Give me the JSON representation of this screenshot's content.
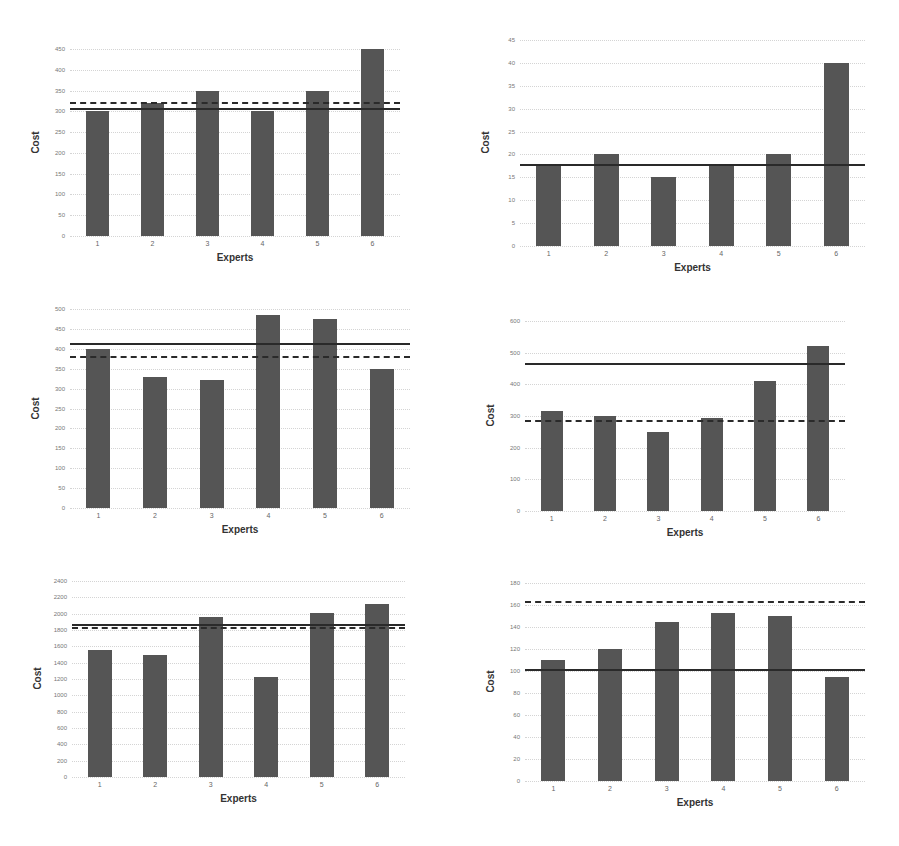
{
  "chart_data": [
    {
      "type": "bar",
      "position": "top-left",
      "title": "",
      "xlabel": "Experts",
      "ylabel": "Cost",
      "categories": [
        "1",
        "2",
        "3",
        "4",
        "5",
        "6"
      ],
      "values": [
        300,
        320,
        350,
        300,
        350,
        450
      ],
      "ylim": [
        0,
        450
      ],
      "yticks": [
        0,
        50,
        100,
        150,
        200,
        250,
        300,
        350,
        400,
        450
      ],
      "reference_lines": {
        "solid": 305,
        "dashed": 320
      },
      "grid": true
    },
    {
      "type": "bar",
      "position": "top-right",
      "title": "",
      "xlabel": "Experts",
      "ylabel": "Cost",
      "categories": [
        "1",
        "2",
        "3",
        "4",
        "5",
        "6"
      ],
      "values": [
        18,
        20,
        15,
        18,
        20,
        40
      ],
      "ylim": [
        0,
        45
      ],
      "yticks": [
        0,
        5,
        10,
        15,
        20,
        25,
        30,
        35,
        40,
        45
      ],
      "reference_lines": {
        "solid": 17.8,
        "dashed": 17.8
      },
      "grid": true
    },
    {
      "type": "bar",
      "position": "middle-left",
      "title": "",
      "xlabel": "Experts",
      "ylabel": "Cost",
      "categories": [
        "1",
        "2",
        "3",
        "4",
        "5",
        "6"
      ],
      "values": [
        400,
        330,
        322,
        485,
        475,
        350
      ],
      "ylim": [
        0,
        500
      ],
      "yticks": [
        0,
        50,
        100,
        150,
        200,
        250,
        300,
        350,
        400,
        450,
        500
      ],
      "reference_lines": {
        "solid": 412,
        "dashed": 380
      },
      "grid": true
    },
    {
      "type": "bar",
      "position": "middle-right",
      "title": "",
      "xlabel": "Experts",
      "ylabel": "Cost",
      "categories": [
        "1",
        "2",
        "3",
        "4",
        "5",
        "6"
      ],
      "values": [
        315,
        300,
        250,
        295,
        410,
        520
      ],
      "ylim": [
        0,
        600
      ],
      "yticks": [
        0,
        100,
        200,
        300,
        400,
        500,
        600
      ],
      "reference_lines": {
        "solid": 465,
        "dashed": 285
      },
      "grid": true
    },
    {
      "type": "bar",
      "position": "bottom-left",
      "title": "",
      "xlabel": "Experts",
      "ylabel": "Cost",
      "categories": [
        "1",
        "2",
        "3",
        "4",
        "5",
        "6"
      ],
      "values": [
        1550,
        1500,
        1960,
        1220,
        2010,
        2120
      ],
      "ylim": [
        0,
        2400
      ],
      "yticks": [
        0,
        200,
        400,
        600,
        800,
        1000,
        1200,
        1400,
        1600,
        1800,
        2000,
        2200,
        2400
      ],
      "reference_lines": {
        "solid": 1860,
        "dashed": 1820
      },
      "grid": true
    },
    {
      "type": "bar",
      "position": "bottom-right",
      "title": "",
      "xlabel": "Experts",
      "ylabel": "Cost",
      "categories": [
        "1",
        "2",
        "3",
        "4",
        "5",
        "6"
      ],
      "values": [
        110,
        120,
        145,
        153,
        150,
        95
      ],
      "ylim": [
        0,
        180
      ],
      "yticks": [
        0,
        20,
        40,
        60,
        80,
        100,
        120,
        140,
        160,
        180
      ],
      "reference_lines": {
        "solid": 101,
        "dashed": 163
      },
      "grid": true
    }
  ],
  "layout": [
    {
      "left": 70,
      "top": 49,
      "width": 330,
      "height": 187,
      "barWidth": 23
    },
    {
      "left": 520,
      "top": 40,
      "width": 345,
      "height": 206,
      "barWidth": 25
    },
    {
      "left": 70,
      "top": 309,
      "width": 340,
      "height": 199,
      "barWidth": 24
    },
    {
      "left": 525,
      "top": 321,
      "width": 320,
      "height": 190,
      "barWidth": 22
    },
    {
      "left": 72,
      "top": 581,
      "width": 333,
      "height": 196,
      "barWidth": 24
    },
    {
      "left": 525,
      "top": 583,
      "width": 340,
      "height": 198,
      "barWidth": 24
    }
  ],
  "colors": {
    "bar": "#555555",
    "line": "#2a2a2a",
    "grid": "#d4d4d4"
  }
}
